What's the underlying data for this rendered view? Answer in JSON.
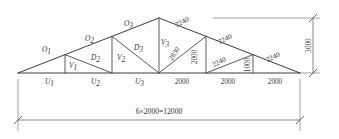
{
  "diagram": {
    "span_label": "6×2000=12000",
    "height_label": "3000",
    "units_note": "",
    "geometry": {
      "left_support_x": 18,
      "right_support_x": 300,
      "bottom_chord_y": 73,
      "apex_x": 159,
      "apex_y": 18,
      "panel_count": 6,
      "panel_width_mm": 2000,
      "span_mm": 12000,
      "rise_mm": 3000
    },
    "member_labels": [
      {
        "id": "O1",
        "base": "O",
        "sub": "1",
        "x": 42,
        "y": 52
      },
      {
        "id": "O2",
        "base": "O",
        "sub": "2",
        "x": 85,
        "y": 41
      },
      {
        "id": "O3",
        "base": "O",
        "sub": "3",
        "x": 124,
        "y": 26
      },
      {
        "id": "U1",
        "base": "U",
        "sub": "1",
        "x": 45,
        "y": 84
      },
      {
        "id": "U2",
        "base": "U",
        "sub": "2",
        "x": 91,
        "y": 84
      },
      {
        "id": "U3",
        "base": "U",
        "sub": "3",
        "x": 135,
        "y": 84
      },
      {
        "id": "V1",
        "base": "V",
        "sub": "1",
        "x": 69,
        "y": 68
      },
      {
        "id": "V2",
        "base": "V",
        "sub": "2",
        "x": 117,
        "y": 60
      },
      {
        "id": "V3",
        "base": "V",
        "sub": "3",
        "x": 161,
        "y": 45
      },
      {
        "id": "D2",
        "base": "D",
        "sub": "2",
        "x": 91,
        "y": 60
      },
      {
        "id": "D3",
        "base": "D",
        "sub": "3",
        "x": 134,
        "y": 50
      }
    ],
    "dimension_labels": [
      {
        "id": "top-chord-right-1",
        "text": "2240",
        "x": 183,
        "y": 24,
        "rotate": -28
      },
      {
        "id": "diagonal-2830",
        "text": "2830",
        "x": 176,
        "y": 55,
        "rotate": -55
      },
      {
        "id": "vertical-2000-a",
        "text": "2000",
        "x": 197,
        "y": 57,
        "rotate": -90
      },
      {
        "id": "top-chord-right-2",
        "text": "2240",
        "x": 226,
        "y": 41,
        "rotate": -28
      },
      {
        "id": "diagonal-2240",
        "text": "2240",
        "x": 220,
        "y": 64,
        "rotate": -28
      },
      {
        "id": "vertical-1000",
        "text": "1000",
        "x": 250,
        "y": 65,
        "rotate": -90
      },
      {
        "id": "top-chord-right-3",
        "text": "2240",
        "x": 272,
        "y": 59,
        "rotate": -28
      }
    ],
    "bottom_panel_labels": [
      {
        "id": "panel-4",
        "text": "2000",
        "x": 182,
        "y": 84
      },
      {
        "id": "panel-5",
        "text": "2000",
        "x": 228,
        "y": 84
      },
      {
        "id": "panel-6",
        "text": "2000",
        "x": 275,
        "y": 84
      }
    ],
    "colors": {
      "line": "#4a4a4a",
      "dimension": "#6e6e6e",
      "text": "#3a3a3a",
      "background": "#fdfdfd"
    }
  }
}
